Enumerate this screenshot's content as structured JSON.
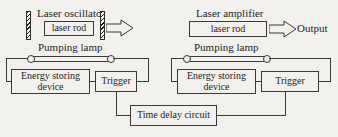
{
  "diagram": {
    "title_semantic": "laser-oscillator-amplifier-block-diagram",
    "background_color": "#f2f1ed",
    "line_color": "#3a3a3a",
    "text_color": "#262626"
  },
  "oscillator": {
    "section_label": "Laser oscillator",
    "rod_label": "laser rod",
    "lamp_label": "Pumping lamp",
    "energy_label_line1": "Energy storing",
    "energy_label_line2": "device",
    "trigger_label": "Trigger",
    "left_mirror_name": "total-reflector-mirror",
    "right_mirror_name": "output-coupler-mirror"
  },
  "amplifier": {
    "section_label": "Laser amplifier",
    "rod_label": "laser rod",
    "lamp_label": "Pumping lamp",
    "energy_label_line1": "Energy storing",
    "energy_label_line2": "device",
    "trigger_label": "Trigger",
    "output_label": "Output"
  },
  "shared": {
    "time_delay_label": "Time delay circuit"
  }
}
